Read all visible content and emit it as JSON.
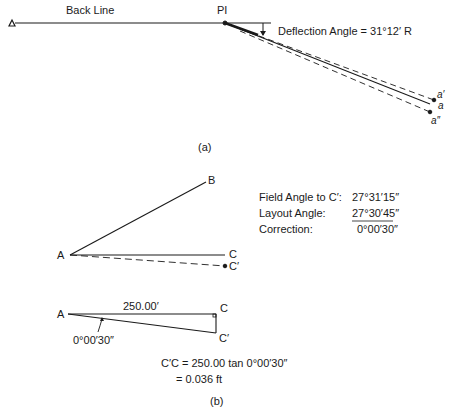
{
  "figure_a": {
    "caption": "(a)",
    "back_line_label": "Back Line",
    "pi_label": "PI",
    "deflection_label": "Deflection Angle = 31°12′ R",
    "points": {
      "a_prime": "a′",
      "a": "a",
      "a_double_prime": "a″"
    }
  },
  "figure_b": {
    "caption": "(b)",
    "angle_diagram": {
      "point_a": "A",
      "point_b": "B",
      "point_c": "C",
      "point_c_prime": "C′"
    },
    "table": {
      "rows": [
        {
          "label": "Field Angle to C′:",
          "value": "27°31′15″"
        },
        {
          "label": "Layout Angle:",
          "value": "27°30′45″"
        },
        {
          "label": "Correction:",
          "value": "0°00′30″"
        }
      ]
    },
    "triangle": {
      "point_a": "A",
      "point_c": "C",
      "point_c_prime": "C′",
      "distance_label": "250.00′",
      "angle_label": "0°00′30″"
    },
    "formula": {
      "line1": "C′C = 250.00 tan 0°00′30″",
      "line2": "= 0.036 ft"
    }
  },
  "colors": {
    "line": "#1a1a1a",
    "background": "#ffffff"
  }
}
